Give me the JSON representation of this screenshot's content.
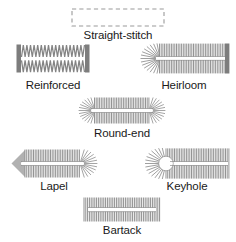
{
  "diagram": {
    "background_color": "#ffffff",
    "stitch_color": "#8a8a8a",
    "stitch_color_dark": "#6e6e6e",
    "outline_color": "#999999",
    "label_color": "#1a1a1a",
    "items": [
      {
        "id": "straight-stitch",
        "label": "Straight-stitch",
        "shape": "dashed-rectangle",
        "x": 71,
        "y": 8,
        "width": 94,
        "height": 19,
        "label_x": 64,
        "label_y": 29,
        "label_width": 108
      },
      {
        "id": "reinforced",
        "label": "Reinforced",
        "shape": "zigzag-bar-ends",
        "x": 16,
        "y": 44,
        "width": 74,
        "height": 29,
        "label_x": 0,
        "label_y": 79,
        "label_width": 106
      },
      {
        "id": "heirloom",
        "label": "Heirloom",
        "shape": "tapered-fan-left",
        "x": 138,
        "y": 43,
        "width": 92,
        "height": 31,
        "label_x": 138,
        "label_y": 79,
        "label_width": 92
      },
      {
        "id": "round-end",
        "label": "Round-end",
        "shape": "rounded-both-ends",
        "x": 78,
        "y": 97,
        "width": 88,
        "height": 27,
        "label_x": 72,
        "label_y": 127,
        "label_width": 100
      },
      {
        "id": "lapel",
        "label": "Lapel",
        "shape": "pointed-left-round-right",
        "x": 10,
        "y": 149,
        "width": 88,
        "height": 29,
        "label_x": 10,
        "label_y": 180,
        "label_width": 88
      },
      {
        "id": "keyhole",
        "label": "Keyhole",
        "shape": "keyhole-left",
        "x": 144,
        "y": 148,
        "width": 86,
        "height": 31,
        "label_x": 144,
        "label_y": 180,
        "label_width": 86
      },
      {
        "id": "bartack",
        "label": "Bartack",
        "shape": "flat-bar-ends",
        "x": 83,
        "y": 197,
        "width": 78,
        "height": 25,
        "label_x": 78,
        "label_y": 224,
        "label_width": 88
      }
    ]
  }
}
